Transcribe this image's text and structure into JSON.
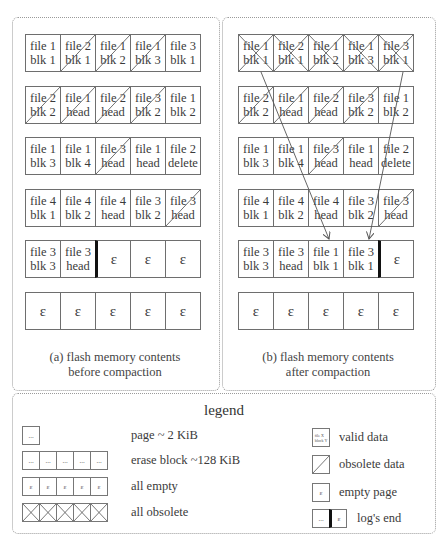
{
  "panels": {
    "before": {
      "caption_line1": "(a) flash memory contents",
      "caption_line2": "before compaction",
      "rows": [
        [
          {
            "text": "file 1\nblk 1",
            "state": "valid"
          },
          {
            "text": "file 2\nblk 1",
            "state": "obsolete"
          },
          {
            "text": "file 1\nblk 2",
            "state": "obsolete"
          },
          {
            "text": "file 1\nblk 3",
            "state": "obsolete"
          },
          {
            "text": "file 3\nblk 1",
            "state": "valid"
          }
        ],
        [
          {
            "text": "file 2\nblk 2",
            "state": "obsolete"
          },
          {
            "text": "file 1\nhead",
            "state": "obsolete"
          },
          {
            "text": "file 2\nhead",
            "state": "obsolete"
          },
          {
            "text": "file 3\nblk 2",
            "state": "obsolete"
          },
          {
            "text": "file 1\nblk 2",
            "state": "valid"
          }
        ],
        [
          {
            "text": "file 1\nblk 3",
            "state": "valid"
          },
          {
            "text": "file 1\nblk 4",
            "state": "valid"
          },
          {
            "text": "file 3\nhead",
            "state": "obsolete"
          },
          {
            "text": "file 1\nhead",
            "state": "valid"
          },
          {
            "text": "file 2\ndelete",
            "state": "valid"
          }
        ],
        [
          {
            "text": "file 4\nblk 1",
            "state": "valid"
          },
          {
            "text": "file 4\nblk 2",
            "state": "valid"
          },
          {
            "text": "file 4\nhead",
            "state": "valid"
          },
          {
            "text": "file 3\nblk 2",
            "state": "valid"
          },
          {
            "text": "file 3\nhead",
            "state": "obsolete"
          }
        ],
        [
          {
            "text": "file 3\nblk 3",
            "state": "valid"
          },
          {
            "text": "file 3\nhead",
            "state": "valid"
          },
          {
            "text": "ε",
            "state": "empty",
            "log_end": true
          },
          {
            "text": "ε",
            "state": "empty"
          },
          {
            "text": "ε",
            "state": "empty"
          }
        ],
        [
          {
            "text": "ε",
            "state": "empty"
          },
          {
            "text": "ε",
            "state": "empty"
          },
          {
            "text": "ε",
            "state": "empty"
          },
          {
            "text": "ε",
            "state": "empty"
          },
          {
            "text": "ε",
            "state": "empty"
          }
        ]
      ]
    },
    "after": {
      "caption_line1": "(b) flash memory contents",
      "caption_line2": "after compaction",
      "rows": [
        [
          {
            "text": "file 1\nblk 1",
            "state": "erased"
          },
          {
            "text": "file 2\nblk 1",
            "state": "erased"
          },
          {
            "text": "file 1\nblk 2",
            "state": "erased"
          },
          {
            "text": "file 1\nblk 3",
            "state": "erased"
          },
          {
            "text": "file 3\nblk 1",
            "state": "erased"
          }
        ],
        [
          {
            "text": "file 2\nblk 2",
            "state": "obsolete"
          },
          {
            "text": "file 1\nhead",
            "state": "obsolete"
          },
          {
            "text": "file 2\nhead",
            "state": "obsolete"
          },
          {
            "text": "file 3\nblk 2",
            "state": "obsolete"
          },
          {
            "text": "file 1\nblk 2",
            "state": "valid"
          }
        ],
        [
          {
            "text": "file 1\nblk 3",
            "state": "valid"
          },
          {
            "text": "file 1\nblk 4",
            "state": "valid"
          },
          {
            "text": "file 3\nhead",
            "state": "obsolete"
          },
          {
            "text": "file 1\nhead",
            "state": "valid"
          },
          {
            "text": "file 2\ndelete",
            "state": "valid"
          }
        ],
        [
          {
            "text": "file 4\nblk 1",
            "state": "valid"
          },
          {
            "text": "file 4\nblk 2",
            "state": "valid"
          },
          {
            "text": "file 4\nhead",
            "state": "valid"
          },
          {
            "text": "file 3\nblk 2",
            "state": "valid"
          },
          {
            "text": "file 3\nhead",
            "state": "obsolete"
          }
        ],
        [
          {
            "text": "file 3\nblk 3",
            "state": "valid"
          },
          {
            "text": "file 3\nhead",
            "state": "valid"
          },
          {
            "text": "file 1\nblk 1",
            "state": "valid"
          },
          {
            "text": "file 3\nblk 1",
            "state": "valid"
          },
          {
            "text": "ε",
            "state": "empty",
            "log_end": true
          }
        ],
        [
          {
            "text": "ε",
            "state": "empty"
          },
          {
            "text": "ε",
            "state": "empty"
          },
          {
            "text": "ε",
            "state": "empty"
          },
          {
            "text": "ε",
            "state": "empty"
          },
          {
            "text": "ε",
            "state": "empty"
          }
        ]
      ],
      "arrows": [
        {
          "label": "move file 1 blk 1",
          "from": [
            261,
            72
          ],
          "to": [
            329,
            239
          ]
        },
        {
          "label": "move file 3 blk 1",
          "from": [
            403,
            72
          ],
          "to": [
            369,
            239
          ]
        }
      ]
    }
  },
  "legend": {
    "title": "legend",
    "left_items": [
      {
        "symbol": "page",
        "glyph": "...",
        "label": "page ~ 2 KiB"
      },
      {
        "symbol": "erase-block",
        "glyph": "...",
        "label": "erase block ~128 KiB"
      },
      {
        "symbol": "all-empty",
        "glyph": "ε",
        "label": "all empty"
      },
      {
        "symbol": "all-obsolete",
        "glyph": "",
        "label": "all obsolete"
      }
    ],
    "right_items": [
      {
        "symbol": "valid-data",
        "glyph": "file X\nblock Y",
        "label": "valid data"
      },
      {
        "symbol": "obsolete-data",
        "glyph": "",
        "label": "obsolete data"
      },
      {
        "symbol": "empty-page",
        "glyph": "ε",
        "label": "empty page"
      },
      {
        "symbol": "logs-end",
        "glyph_left": "...",
        "glyph_right": "ε",
        "label": "log's end"
      }
    ]
  },
  "colors": {
    "border": "#6e6e6e",
    "text": "#3a3a3a",
    "log_end": "#111111",
    "dotted_frame": "#9a9a9a"
  }
}
